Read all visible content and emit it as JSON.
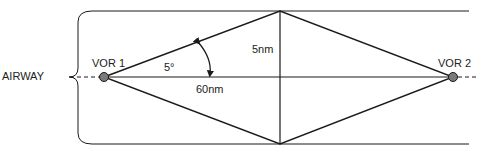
{
  "diagram": {
    "airway_label": "AIRWAY",
    "vor1_label": "VOR 1",
    "vor2_label": "VOR 2",
    "angle_label": "5°",
    "half_width_label": "5nm",
    "distance_label": "60nm",
    "colors": {
      "line": "#1a1a1a",
      "station_fill": "#7a7a7a",
      "background": "#ffffff"
    }
  }
}
